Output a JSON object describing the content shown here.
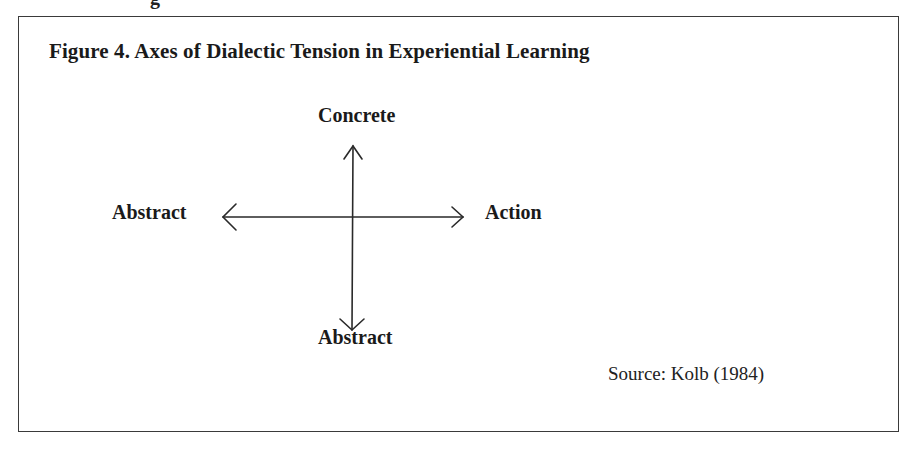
{
  "page": {
    "cut_off_text_above": "g"
  },
  "figure": {
    "title": "Figure 4. Axes of Dialectic Tension in Experiential Learning",
    "source": "Source: Kolb (1984)",
    "axes": {
      "vertical": {
        "top_label": "Concrete",
        "bottom_label": "Abstract",
        "arrowheads": [
          "up",
          "down"
        ]
      },
      "horizontal": {
        "left_label": "Abstract",
        "right_label": "Action",
        "arrowheads": [
          "left",
          "right"
        ]
      }
    },
    "colors": {
      "line": "#2a2a2a",
      "border": "#3a3a3a",
      "text": "#1a1a1a"
    }
  }
}
